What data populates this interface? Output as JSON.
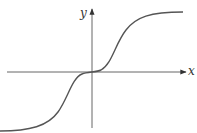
{
  "diagram": {
    "type": "function-graph",
    "axes": {
      "x_label": "x",
      "y_label": "y"
    },
    "colors": {
      "curve": "#555555",
      "axes": "#333333",
      "background": "#ffffff"
    }
  }
}
